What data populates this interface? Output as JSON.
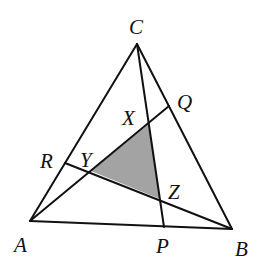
{
  "diagram": {
    "type": "triangle-cevians",
    "colors": {
      "stroke": "#111111",
      "shade": "#a3a3a3",
      "background": "#ffffff"
    },
    "points": {
      "A": {
        "x": 30,
        "y": 221
      },
      "B": {
        "x": 232,
        "y": 229
      },
      "C": {
        "x": 137,
        "y": 44
      },
      "P": {
        "x": 164,
        "y": 227
      },
      "Q": {
        "x": 169,
        "y": 106
      },
      "R": {
        "x": 65,
        "y": 163
      },
      "X": {
        "x": 149,
        "y": 124
      },
      "Y": {
        "x": 91,
        "y": 171
      },
      "Z": {
        "x": 160,
        "y": 199
      }
    },
    "segments": [
      {
        "from": "A",
        "to": "B",
        "name": "side-ab"
      },
      {
        "from": "B",
        "to": "C",
        "name": "side-bc"
      },
      {
        "from": "C",
        "to": "A",
        "name": "side-ca"
      },
      {
        "from": "C",
        "to": "P",
        "name": "cevian-cp"
      },
      {
        "from": "A",
        "to": "Q",
        "name": "cevian-aq"
      },
      {
        "from": "B",
        "to": "R",
        "name": "cevian-br"
      }
    ],
    "shaded_triangle": [
      "X",
      "Y",
      "Z"
    ],
    "labels": [
      {
        "text": "C",
        "x": 129,
        "y": 34
      },
      {
        "text": "Q",
        "x": 177,
        "y": 109
      },
      {
        "text": "X",
        "x": 122,
        "y": 125
      },
      {
        "text": "R",
        "x": 40,
        "y": 168
      },
      {
        "text": "Y",
        "x": 80,
        "y": 167
      },
      {
        "text": "Z",
        "x": 168,
        "y": 199
      },
      {
        "text": "A",
        "x": 14,
        "y": 252
      },
      {
        "text": "P",
        "x": 156,
        "y": 253
      },
      {
        "text": "B",
        "x": 235,
        "y": 256
      }
    ]
  }
}
